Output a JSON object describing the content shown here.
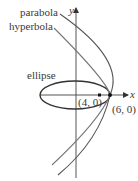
{
  "diagram": {
    "labels": {
      "parabola": "parabola",
      "hyperbola": "hyperbola",
      "ellipse": "ellipse",
      "x_axis": "x",
      "y_axis": "y",
      "point_inner": "(4, 0)",
      "point_outer": "(6, 0)"
    },
    "colors": {
      "curve": "#4a4a4a",
      "axis": "#555555",
      "point": "#111111"
    }
  }
}
